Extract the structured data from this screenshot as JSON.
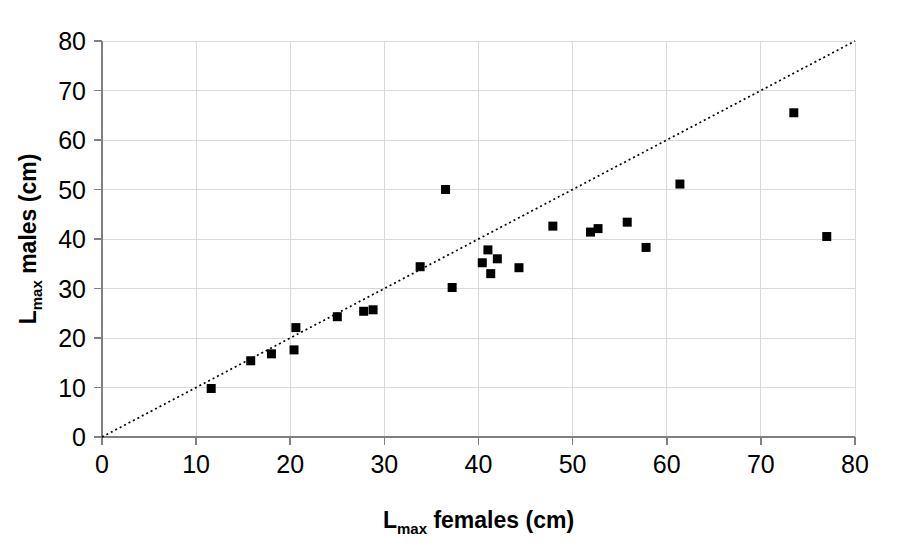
{
  "chart_data": {
    "type": "scatter",
    "title": "",
    "xlabel": "L max females (cm)",
    "ylabel": "L max males (cm)",
    "xlabel_main": "L",
    "xlabel_sub": "max",
    "xlabel_rest": " females (cm)",
    "ylabel_main": "L",
    "ylabel_sub": "max",
    "ylabel_rest": " males (cm)",
    "xlim": [
      0,
      80
    ],
    "ylim": [
      0,
      80
    ],
    "xticks": [
      0,
      10,
      20,
      30,
      40,
      50,
      60,
      70,
      80
    ],
    "yticks": [
      0,
      10,
      20,
      30,
      40,
      50,
      60,
      70,
      80
    ],
    "xtick_labels": [
      "0",
      "10",
      "20",
      "30",
      "40",
      "50",
      "60",
      "70",
      "80"
    ],
    "ytick_labels": [
      "0",
      "10",
      "20",
      "30",
      "40",
      "50",
      "60",
      "70",
      "80"
    ],
    "grid": true,
    "legend": "none",
    "marker": "square",
    "marker_color": "#000000",
    "marker_size": 9,
    "series": [
      {
        "name": "species",
        "points": [
          [
            11.6,
            9.8
          ],
          [
            15.8,
            15.4
          ],
          [
            18.0,
            16.8
          ],
          [
            20.4,
            17.6
          ],
          [
            20.6,
            22.1
          ],
          [
            25.0,
            24.3
          ],
          [
            27.8,
            25.4
          ],
          [
            28.8,
            25.7
          ],
          [
            33.8,
            34.4
          ],
          [
            36.5,
            50.0
          ],
          [
            37.2,
            30.2
          ],
          [
            40.4,
            35.2
          ],
          [
            41.0,
            37.8
          ],
          [
            41.3,
            33.0
          ],
          [
            42.0,
            36.0
          ],
          [
            44.3,
            34.2
          ],
          [
            47.9,
            42.6
          ],
          [
            51.9,
            41.4
          ],
          [
            52.7,
            42.1
          ],
          [
            55.8,
            43.4
          ],
          [
            57.8,
            38.3
          ],
          [
            61.4,
            51.1
          ],
          [
            73.5,
            65.5
          ],
          [
            77.0,
            40.5
          ]
        ]
      }
    ],
    "reference_line": {
      "name": "1:1 isometry line",
      "style": "dotted",
      "from": [
        0,
        0
      ],
      "to": [
        80,
        80
      ]
    }
  }
}
